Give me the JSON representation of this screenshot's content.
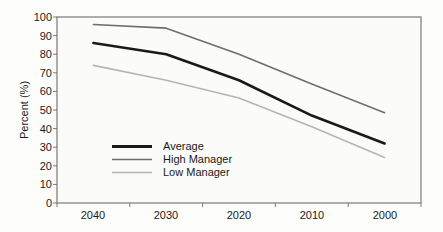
{
  "chart_data": {
    "type": "line",
    "title": "",
    "xlabel": "",
    "ylabel": "Percent (%)",
    "x": [
      "2040",
      "2030",
      "2020",
      "2010",
      "2000"
    ],
    "categories": [
      "2040",
      "2030",
      "2020",
      "2010",
      "2000"
    ],
    "series": [
      {
        "name": "Average",
        "values": [
          86,
          80,
          66,
          47,
          32
        ],
        "color": "#1a1a1a",
        "width": 2.6
      },
      {
        "name": "High Manager",
        "values": [
          96,
          94,
          80,
          64,
          48.5
        ],
        "color": "#6e6e6e",
        "width": 1.6
      },
      {
        "name": "Low Manager",
        "values": [
          74,
          66,
          56.5,
          41,
          24.5
        ],
        "color": "#b5b5b5",
        "width": 1.6
      }
    ],
    "ylim": [
      0,
      100
    ],
    "ytick_step": 10,
    "yticks": [
      "0",
      "10",
      "20",
      "30",
      "40",
      "50",
      "60",
      "70",
      "80",
      "90",
      "100"
    ],
    "xticks": [
      "2040",
      "2030",
      "2020",
      "2010",
      "2000"
    ],
    "grid": false,
    "legend_position": "inside-lower-left",
    "legend_entries": [
      "Average",
      "High Manager",
      "Low Manager"
    ],
    "plot_background": "#fbfbfa",
    "axis_color": "#7a7a7a",
    "text_color": "#1a1a1a"
  },
  "axis": {
    "y_title": "Percent (%)"
  },
  "legend": {
    "items": [
      {
        "label": "Average"
      },
      {
        "label": "High Manager"
      },
      {
        "label": "Low Manager"
      }
    ]
  },
  "yticks": {
    "t0": "0",
    "t1": "10",
    "t2": "20",
    "t3": "30",
    "t4": "40",
    "t5": "50",
    "t6": "60",
    "t7": "70",
    "t8": "80",
    "t9": "90",
    "t10": "100"
  },
  "xticks": {
    "x0": "2040",
    "x1": "2030",
    "x2": "2020",
    "x3": "2010",
    "x4": "2000"
  }
}
